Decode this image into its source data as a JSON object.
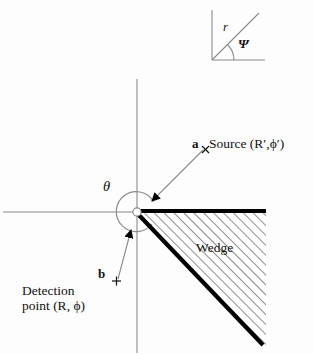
{
  "figure": {
    "background_color": "#fdfdfd",
    "axis_color": "#7d7d7d",
    "wedge_edge_color": "#000000",
    "hatch_color": "#4d4d4d"
  },
  "labels": {
    "vector_a": "a",
    "source": "Source (R′,ϕ′)",
    "vector_b": "b",
    "detection_line1": "Detection",
    "detection_line2": "point (R, ϕ)",
    "theta": "θ",
    "wedge": "Wedge",
    "inset_r": "r",
    "inset_psi": "Ψ"
  },
  "markers": {
    "source_marker": "×",
    "detection_marker": "+"
  },
  "geometry": {
    "vertex": {
      "x": 137,
      "y": 212
    },
    "source_point": {
      "x": 205,
      "y": 149
    },
    "detection_point": {
      "x": 116,
      "y": 281
    },
    "horizontal_axis": {
      "x1": 3,
      "y1": 212,
      "x2": 137,
      "y2": 212
    },
    "vertical_axis": {
      "x1": 137,
      "y1": 79,
      "x2": 137,
      "y2": 353
    },
    "wedge_top_edge": {
      "x1": 137,
      "y1": 211,
      "x2": 266,
      "y2": 211
    },
    "wedge_diagonal_edge": {
      "x1": 137,
      "y1": 212,
      "x2": 263,
      "y2": 345
    },
    "theta_arc_radius": 20,
    "inset_box": {
      "x": 212,
      "y": 10,
      "w": 52,
      "h": 50
    }
  }
}
